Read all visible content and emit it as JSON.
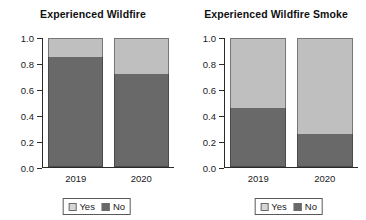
{
  "chart_data": [
    {
      "type": "bar",
      "subtype": "stacked-100-percent",
      "title": "Experienced Wildfire",
      "xlabel": "",
      "ylabel": "",
      "categories": [
        "2019",
        "2020"
      ],
      "series": [
        {
          "name": "Yes",
          "values": [
            0.145,
            0.28
          ],
          "color": "#bfbfbf"
        },
        {
          "name": "No",
          "values": [
            0.855,
            0.72
          ],
          "color": "#696969"
        }
      ],
      "ylim": [
        0.0,
        1.0
      ],
      "yticks": [
        "0.0",
        "0.2",
        "0.4",
        "0.6",
        "0.8",
        "1.0"
      ],
      "ytick_values": [
        0.0,
        0.2,
        0.4,
        0.6,
        0.8,
        1.0
      ],
      "grid": false,
      "legend_position": "bottom-center",
      "legend_entries": [
        "Yes",
        "No"
      ]
    },
    {
      "type": "bar",
      "subtype": "stacked-100-percent",
      "title": "Experienced Wildfire Smoke",
      "xlabel": "",
      "ylabel": "",
      "categories": [
        "2019",
        "2020"
      ],
      "series": [
        {
          "name": "Yes",
          "values": [
            0.54,
            0.745
          ],
          "color": "#bfbfbf"
        },
        {
          "name": "No",
          "values": [
            0.46,
            0.255
          ],
          "color": "#696969"
        }
      ],
      "ylim": [
        0.0,
        1.0
      ],
      "yticks": [
        "0.0",
        "0.2",
        "0.4",
        "0.6",
        "0.8",
        "1.0"
      ],
      "ytick_values": [
        0.0,
        0.2,
        0.4,
        0.6,
        0.8,
        1.0
      ],
      "grid": false,
      "legend_position": "bottom-center",
      "legend_entries": [
        "Yes",
        "No"
      ]
    }
  ],
  "panels": [
    {
      "title": "Experienced Wildfire",
      "yticks": [
        {
          "label": "1.0",
          "value": 1.0
        },
        {
          "label": "0.8",
          "value": 0.8
        },
        {
          "label": "0.6",
          "value": 0.6
        },
        {
          "label": "0.4",
          "value": 0.4
        },
        {
          "label": "0.2",
          "value": 0.2
        },
        {
          "label": "0.0",
          "value": 0.0
        }
      ],
      "groups": [
        {
          "label": "2019",
          "yes": 0.145,
          "no": 0.855
        },
        {
          "label": "2020",
          "yes": 0.28,
          "no": 0.72
        }
      ],
      "legend": [
        {
          "label": "Yes",
          "color": "#d6d6d6"
        },
        {
          "label": "No",
          "color": "#696969"
        }
      ]
    },
    {
      "title": "Experienced Wildfire Smoke",
      "yticks": [
        {
          "label": "1.0",
          "value": 1.0
        },
        {
          "label": "0.8",
          "value": 0.8
        },
        {
          "label": "0.6",
          "value": 0.6
        },
        {
          "label": "0.4",
          "value": 0.4
        },
        {
          "label": "0.2",
          "value": 0.2
        },
        {
          "label": "0.0",
          "value": 0.0
        }
      ],
      "groups": [
        {
          "label": "2019",
          "yes": 0.54,
          "no": 0.46
        },
        {
          "label": "2020",
          "yes": 0.745,
          "no": 0.255
        }
      ],
      "legend": [
        {
          "label": "Yes",
          "color": "#d6d6d6"
        },
        {
          "label": "No",
          "color": "#696969"
        }
      ]
    }
  ],
  "colors": {
    "yes": "#bfbfbf",
    "no": "#696969",
    "axis": "#2b2b2b",
    "text": "#1a1a1a",
    "background": "#ffffff"
  }
}
